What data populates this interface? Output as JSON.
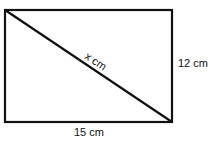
{
  "diagram": {
    "shape": "rectangle",
    "labels": {
      "diagonal": "x cm",
      "height": "12 cm",
      "width": "15 cm"
    },
    "colors": {
      "stroke": "#111111",
      "background": "#ffffff"
    }
  }
}
